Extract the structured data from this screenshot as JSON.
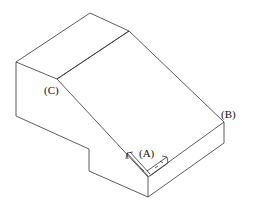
{
  "diagram": {
    "type": "isometric-block",
    "labels": {
      "a": "(A)",
      "b": "(B)",
      "c": "(C)"
    },
    "colors": {
      "stroke": "#333333",
      "background": "#ffffff"
    }
  }
}
